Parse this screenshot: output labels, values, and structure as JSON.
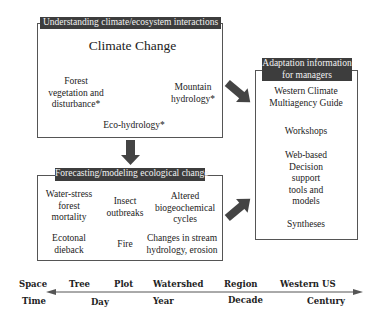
{
  "understanding_box": {
    "header": "Understanding climate/ecosystem interactions",
    "title": "Climate Change",
    "nodes": {
      "forest": [
        "Forest",
        "vegetation and",
        "disturbance*"
      ],
      "mountain": [
        "Mountain",
        "hydrology*"
      ],
      "eco": "Eco-hydrology*"
    }
  },
  "forecasting_box": {
    "header": "Forecasting/modeling ecological change",
    "items": [
      [
        "Water-stress",
        "forest",
        "mortality"
      ],
      [
        "Insect",
        "outbreaks"
      ],
      [
        "Altered",
        "biogeochemical",
        "cycles"
      ],
      [
        "Ecotonal",
        "dieback"
      ],
      [
        "Fire"
      ],
      [
        "Changes in stream",
        "hydrology, erosion"
      ]
    ]
  },
  "adaptation_box": {
    "header": [
      "Adaptation information",
      "for managers"
    ],
    "items": [
      [
        "Western Climate",
        "Multiagency Guide"
      ],
      [
        "Workshops"
      ],
      [
        "Web-based",
        "Decision",
        "support",
        "tools and",
        "models"
      ],
      [
        "Syntheses"
      ]
    ]
  },
  "scale_axis": {
    "space_label": "Space",
    "time_label": "Time",
    "space_ticks": [
      "Tree",
      "Plot",
      "Watershed",
      "Region",
      "Western US"
    ],
    "time_ticks": [
      "Day",
      "Year",
      "Decade",
      "Century"
    ]
  },
  "colors": {
    "header_bg": "#3d3d3d",
    "arrow_fill": "#444444",
    "border": "#555555"
  }
}
